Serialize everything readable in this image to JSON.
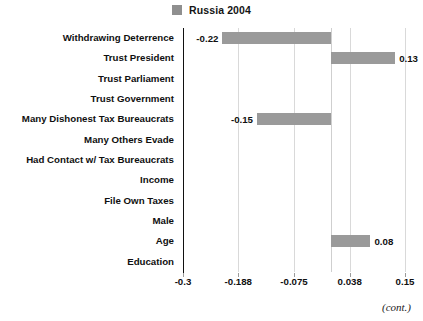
{
  "legend": {
    "label": "Russia 2004",
    "swatch_color": "#8f8f8f",
    "icon": "legend-swatch"
  },
  "footer": {
    "note": "(cont.)"
  },
  "chart_data": {
    "type": "bar",
    "orientation": "horizontal",
    "title": "",
    "subtitle": "",
    "xlabel": "",
    "ylabel": "",
    "grid": true,
    "legend_position": "top-center",
    "xlim": [
      -0.3,
      0.15
    ],
    "xticks": [
      -0.3,
      -0.188,
      -0.075,
      0.038,
      0.15
    ],
    "xticklabels": [
      "-0.3",
      "-0.188",
      "-0.075",
      "0.038",
      "0.15"
    ],
    "categories": [
      "Withdrawing Deterrence",
      "Trust President",
      "Trust Parliament",
      "Trust Government",
      "Many Dishonest Tax Bureaucrats",
      "Many Others Evade",
      "Had Contact w/ Tax Bureaucrats",
      "Income",
      "File Own Taxes",
      "Male",
      "Age",
      "Education"
    ],
    "series": [
      {
        "name": "Russia 2004",
        "color": "#9a9a9a",
        "values": [
          -0.22,
          0.13,
          0,
          0,
          -0.15,
          0,
          0,
          0,
          0,
          0,
          0.08,
          0
        ],
        "data_labels": [
          "-0.22",
          "0.13",
          "",
          "",
          "-0.15",
          "",
          "",
          "",
          "",
          "",
          "0.08",
          ""
        ]
      }
    ]
  }
}
